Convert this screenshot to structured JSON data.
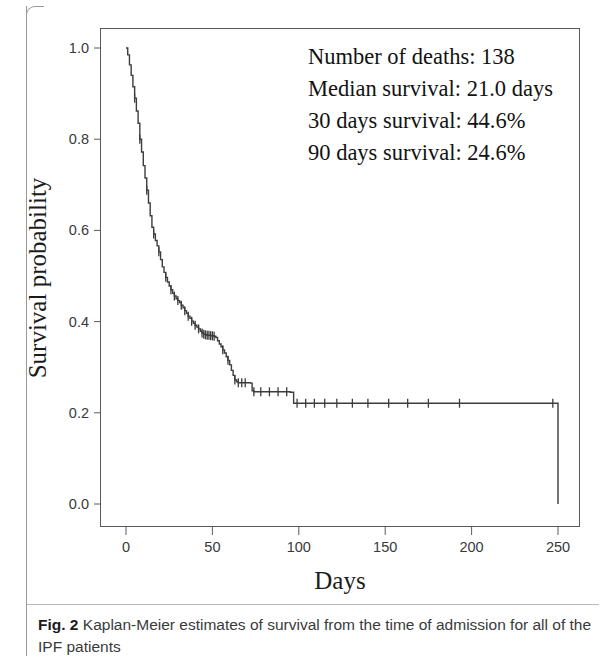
{
  "figure": {
    "caption_label": "Fig. 2",
    "caption_text": "Kaplan-Meier estimates of survival from the time of admission for all of the IPF patients"
  },
  "annotation": {
    "line1": "Number of deaths: 138",
    "line2": "Median survival: 21.0 days",
    "line3": "30 days survival: 44.6%",
    "line4": "90 days survival: 24.6%"
  },
  "chart_data": {
    "type": "line",
    "subtype": "kaplan-meier-survival-curve",
    "title": "",
    "xlabel": "Days",
    "ylabel": "Survival probability",
    "xlim": [
      -5,
      262
    ],
    "ylim": [
      0.0,
      1.04
    ],
    "xticks": [
      0,
      50,
      100,
      150,
      200,
      250
    ],
    "xtick_labels": [
      "0",
      "50",
      "100",
      "150",
      "200",
      "250"
    ],
    "yticks": [
      0.0,
      0.2,
      0.4,
      0.6,
      0.8,
      1.0
    ],
    "ytick_labels": [
      "0.0",
      "0.2",
      "0.4",
      "0.6",
      "0.8",
      "1.0"
    ],
    "grid": false,
    "legend": false,
    "line_color": "#3c3c3c",
    "frame_color": "#5a5a5a",
    "statistics": {
      "number_of_deaths": 138,
      "median_survival_days": 21.0,
      "survival_30_days_percent": 44.6,
      "survival_90_days_percent": 24.6
    },
    "series": [
      {
        "name": "Survival probability",
        "step": "post",
        "points": [
          [
            0,
            1.0
          ],
          [
            1,
            0.985
          ],
          [
            2,
            0.963
          ],
          [
            3,
            0.94
          ],
          [
            4,
            0.915
          ],
          [
            5,
            0.89
          ],
          [
            6,
            0.862
          ],
          [
            7,
            0.835
          ],
          [
            8,
            0.8
          ],
          [
            9,
            0.772
          ],
          [
            10,
            0.742
          ],
          [
            11,
            0.715
          ],
          [
            12,
            0.688
          ],
          [
            13,
            0.66
          ],
          [
            14,
            0.632
          ],
          [
            15,
            0.607
          ],
          [
            16,
            0.592
          ],
          [
            17,
            0.578
          ],
          [
            18,
            0.566
          ],
          [
            19,
            0.553
          ],
          [
            20,
            0.536
          ],
          [
            21,
            0.52
          ],
          [
            22,
            0.508
          ],
          [
            23,
            0.497
          ],
          [
            24,
            0.487
          ],
          [
            25,
            0.478
          ],
          [
            26,
            0.47
          ],
          [
            27,
            0.462
          ],
          [
            28,
            0.456
          ],
          [
            29,
            0.45
          ],
          [
            30,
            0.446
          ],
          [
            31,
            0.442
          ],
          [
            32,
            0.436
          ],
          [
            33,
            0.43
          ],
          [
            34,
            0.424
          ],
          [
            35,
            0.418
          ],
          [
            36,
            0.412
          ],
          [
            37,
            0.407
          ],
          [
            38,
            0.401
          ],
          [
            39,
            0.396
          ],
          [
            40,
            0.392
          ],
          [
            41,
            0.388
          ],
          [
            42,
            0.384
          ],
          [
            43,
            0.379
          ],
          [
            44,
            0.375
          ],
          [
            45,
            0.372
          ],
          [
            46,
            0.371
          ],
          [
            47,
            0.37
          ],
          [
            48,
            0.37
          ],
          [
            49,
            0.369
          ],
          [
            50,
            0.369
          ],
          [
            51,
            0.368
          ],
          [
            52,
            0.365
          ],
          [
            53,
            0.358
          ],
          [
            54,
            0.351
          ],
          [
            55,
            0.345
          ],
          [
            56,
            0.338
          ],
          [
            57,
            0.331
          ],
          [
            58,
            0.323
          ],
          [
            59,
            0.315
          ],
          [
            60,
            0.305
          ],
          [
            61,
            0.293
          ],
          [
            62,
            0.282
          ],
          [
            63,
            0.272
          ],
          [
            64,
            0.268
          ],
          [
            65,
            0.266
          ],
          [
            66,
            0.266
          ],
          [
            67,
            0.266
          ],
          [
            68,
            0.266
          ],
          [
            69,
            0.266
          ],
          [
            70,
            0.266
          ],
          [
            71,
            0.266
          ],
          [
            72,
            0.265
          ],
          [
            73,
            0.248
          ],
          [
            74,
            0.246
          ],
          [
            75,
            0.246
          ],
          [
            80,
            0.246
          ],
          [
            85,
            0.246
          ],
          [
            90,
            0.246
          ],
          [
            92,
            0.246
          ],
          [
            95,
            0.245
          ],
          [
            97,
            0.221
          ],
          [
            100,
            0.221
          ],
          [
            110,
            0.221
          ],
          [
            120,
            0.221
          ],
          [
            130,
            0.221
          ],
          [
            140,
            0.221
          ],
          [
            150,
            0.221
          ],
          [
            160,
            0.221
          ],
          [
            170,
            0.221
          ],
          [
            180,
            0.221
          ],
          [
            190,
            0.221
          ],
          [
            200,
            0.221
          ],
          [
            210,
            0.221
          ],
          [
            220,
            0.221
          ],
          [
            230,
            0.221
          ],
          [
            240,
            0.221
          ],
          [
            249,
            0.221
          ],
          [
            250,
            0.0
          ]
        ],
        "censored_marks": [
          [
            5,
            0.89
          ],
          [
            8,
            0.8
          ],
          [
            12,
            0.688
          ],
          [
            16,
            0.592
          ],
          [
            19,
            0.553
          ],
          [
            23,
            0.497
          ],
          [
            26,
            0.47
          ],
          [
            28,
            0.456
          ],
          [
            30,
            0.446
          ],
          [
            32,
            0.436
          ],
          [
            34,
            0.424
          ],
          [
            36,
            0.412
          ],
          [
            38,
            0.401
          ],
          [
            40,
            0.392
          ],
          [
            42,
            0.384
          ],
          [
            44,
            0.375
          ],
          [
            45,
            0.372
          ],
          [
            46,
            0.371
          ],
          [
            47,
            0.37
          ],
          [
            48,
            0.37
          ],
          [
            49,
            0.369
          ],
          [
            50,
            0.369
          ],
          [
            51,
            0.368
          ],
          [
            56,
            0.338
          ],
          [
            59,
            0.315
          ],
          [
            63,
            0.272
          ],
          [
            65,
            0.266
          ],
          [
            67,
            0.266
          ],
          [
            69,
            0.266
          ],
          [
            74,
            0.246
          ],
          [
            78,
            0.246
          ],
          [
            83,
            0.246
          ],
          [
            88,
            0.246
          ],
          [
            93,
            0.246
          ],
          [
            99,
            0.221
          ],
          [
            104,
            0.221
          ],
          [
            109,
            0.221
          ],
          [
            115,
            0.221
          ],
          [
            122,
            0.221
          ],
          [
            131,
            0.221
          ],
          [
            140,
            0.221
          ],
          [
            152,
            0.221
          ],
          [
            163,
            0.221
          ],
          [
            175,
            0.221
          ],
          [
            193,
            0.221
          ],
          [
            247,
            0.221
          ]
        ]
      }
    ]
  }
}
